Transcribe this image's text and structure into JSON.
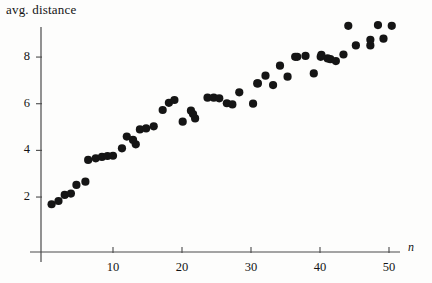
{
  "chart_data": {
    "type": "scatter",
    "title": "",
    "ylabel": "avg. distance",
    "xlabel": "n",
    "xlim": [
      0,
      52
    ],
    "ylim": [
      0,
      9.8
    ],
    "grid": false,
    "legend": null,
    "xticks": [
      10,
      20,
      30,
      40,
      50
    ],
    "yticks": [
      2,
      4,
      6,
      8
    ],
    "marker": {
      "shape": "circle",
      "color": "#151515",
      "radius_px": 4.1
    },
    "axis_color": "#4a4a4a",
    "series": [
      {
        "name": "avg. distance vs n",
        "points": [
          [
            1.1,
            1.69
          ],
          [
            2.1,
            1.83
          ],
          [
            3.0,
            2.09
          ],
          [
            3.9,
            2.15
          ],
          [
            4.7,
            2.52
          ],
          [
            6.0,
            2.66
          ],
          [
            6.4,
            3.59
          ],
          [
            7.5,
            3.66
          ],
          [
            8.4,
            3.72
          ],
          [
            9.2,
            3.76
          ],
          [
            10.0,
            3.77
          ],
          [
            11.3,
            4.09
          ],
          [
            12.0,
            4.59
          ],
          [
            13.3,
            4.26
          ],
          [
            12.9,
            4.45
          ],
          [
            13.9,
            4.9
          ],
          [
            14.8,
            4.94
          ],
          [
            15.9,
            5.03
          ],
          [
            17.2,
            5.73
          ],
          [
            18.1,
            6.04
          ],
          [
            18.9,
            6.16
          ],
          [
            20.1,
            5.23
          ],
          [
            21.3,
            5.7
          ],
          [
            21.9,
            5.37
          ],
          [
            21.6,
            5.56
          ],
          [
            23.7,
            6.26
          ],
          [
            24.6,
            6.26
          ],
          [
            25.4,
            6.23
          ],
          [
            26.5,
            6.02
          ],
          [
            27.3,
            5.97
          ],
          [
            28.3,
            6.49
          ],
          [
            30.9,
            6.87
          ],
          [
            31.0,
            6.87
          ],
          [
            30.3,
            6.0
          ],
          [
            32.1,
            7.2
          ],
          [
            33.2,
            6.8
          ],
          [
            34.2,
            7.63
          ],
          [
            35.3,
            7.16
          ],
          [
            36.4,
            8.01
          ],
          [
            36.7,
            8.01
          ],
          [
            37.9,
            8.05
          ],
          [
            39.1,
            7.3
          ],
          [
            40.1,
            8.01
          ],
          [
            41.1,
            7.94
          ],
          [
            40.2,
            8.09
          ],
          [
            41.5,
            7.91
          ],
          [
            42.3,
            7.83
          ],
          [
            43.4,
            8.11
          ],
          [
            44.1,
            9.34
          ],
          [
            45.2,
            8.5
          ],
          [
            47.3,
            8.5
          ],
          [
            47.3,
            8.74
          ],
          [
            48.4,
            9.37
          ],
          [
            49.2,
            8.79
          ],
          [
            50.4,
            9.34
          ]
        ]
      }
    ]
  },
  "axes": {
    "ylabel_text": "avg. distance",
    "xlabel_text": "n",
    "ytick_labels": [
      "8",
      "6",
      "4",
      "2"
    ],
    "xtick_labels": [
      "10",
      "20",
      "30",
      "40",
      "50"
    ]
  }
}
